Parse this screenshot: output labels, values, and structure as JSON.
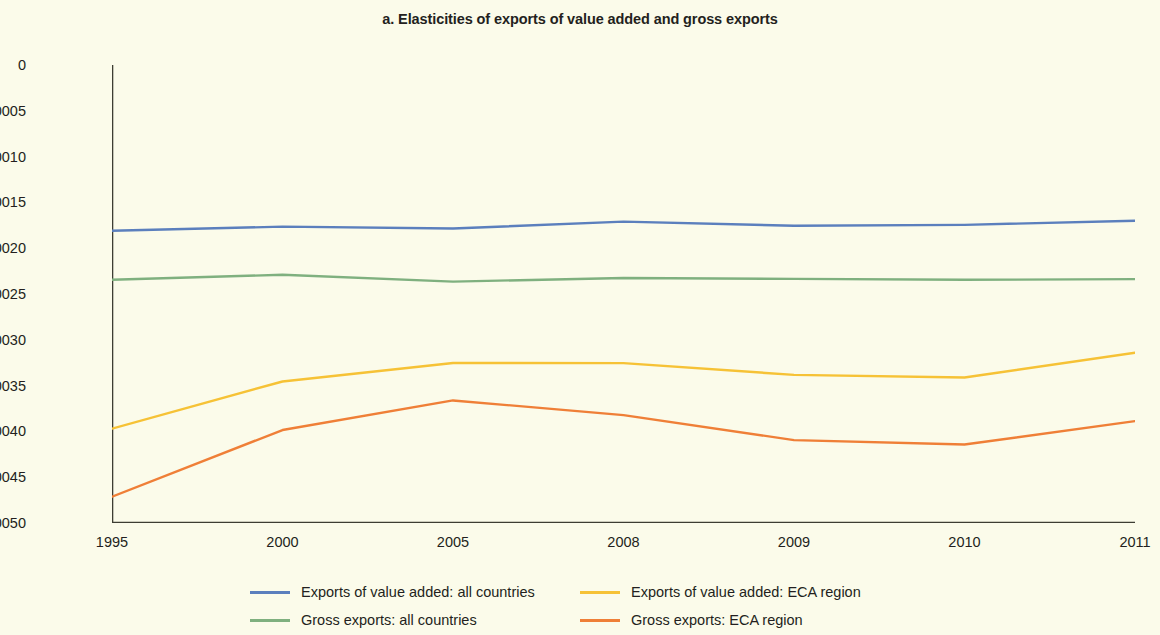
{
  "chart_data": {
    "type": "line",
    "title": "a. Elasticities of exports of value added and gross exports",
    "xlabel": "",
    "ylabel": "",
    "categories": [
      "1995",
      "2000",
      "2005",
      "2008",
      "2009",
      "2010",
      "2011"
    ],
    "ylim": [
      -0.0005,
      0
    ],
    "ytick_labels": [
      "0",
      "–0.00005",
      "–0.00010",
      "–0.00015",
      "–0.00020",
      "–0.00025",
      "–0.00030",
      "–0.00035",
      "–0.00040",
      "–0.00045",
      "–0.00050"
    ],
    "ytick_values": [
      0,
      -5e-05,
      -0.0001,
      -0.00015,
      -0.0002,
      -0.00025,
      -0.0003,
      -0.00035,
      -0.0004,
      -0.00045,
      -0.0005
    ],
    "grid": false,
    "legend_position": "bottom",
    "series": [
      {
        "name": "Exports of value added: all countries",
        "color": "#5b7fbd",
        "values": [
          -0.000181,
          -0.0001765,
          -0.0001785,
          -0.000171,
          -0.0001755,
          -0.0001745,
          -0.00017
        ]
      },
      {
        "name": "Gross exports: all countries",
        "color": "#7fb07f",
        "values": [
          -0.0002345,
          -0.000229,
          -0.0002365,
          -0.0002325,
          -0.0002335,
          -0.0002345,
          -0.0002338
        ]
      },
      {
        "name": "Exports of value added: ECA region",
        "color": "#f6c236",
        "values": [
          -0.000397,
          -0.0003455,
          -0.0003253,
          -0.0003255,
          -0.0003383,
          -0.0003412,
          -0.0003142
        ]
      },
      {
        "name": "Gross exports: ECA region",
        "color": "#ef7f37",
        "values": [
          -0.0004713,
          -0.0003985,
          -0.0003662,
          -0.0003822,
          -0.0004095,
          -0.0004143,
          -0.0003888
        ]
      }
    ]
  },
  "axis": {
    "x_labels": [
      "1995",
      "2000",
      "2005",
      "2008",
      "2009",
      "2010",
      "2011"
    ],
    "y_labels": [
      "0",
      "–0.00005",
      "–0.00010",
      "–0.00015",
      "–0.00020",
      "–0.00025",
      "–0.00030",
      "–0.00035",
      "–0.00040",
      "–0.00045",
      "–0.00050"
    ]
  },
  "legend": {
    "rows": [
      [
        {
          "label": "Exports of value added: all countries",
          "color": "#5b7fbd"
        },
        {
          "label": "Exports of value added: ECA region",
          "color": "#f6c236"
        }
      ],
      [
        {
          "label": "Gross exports: all countries",
          "color": "#7fb07f"
        },
        {
          "label": "Gross exports: ECA region",
          "color": "#ef7f37"
        }
      ]
    ]
  },
  "colors": {
    "background": "#fbfbea",
    "axis": "#3d3d33",
    "text": "#231f20"
  }
}
